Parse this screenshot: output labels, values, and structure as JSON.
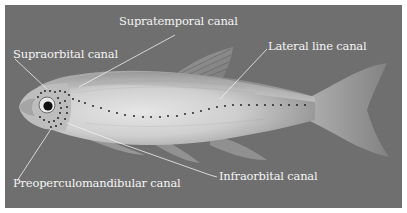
{
  "figure": {
    "background_color": "#6f6f6f",
    "label_color": "#f4f4f4",
    "labels": [
      {
        "id": "supratemporal",
        "text": "Supratemporal canal"
      },
      {
        "id": "supraorbital",
        "text": "Supraorbital canal"
      },
      {
        "id": "lateral-line",
        "text": "Lateral line canal"
      },
      {
        "id": "preoperculomandibular",
        "text": "Preoperculomandibular canal"
      },
      {
        "id": "infraorbital",
        "text": "Infraorbital canal"
      }
    ]
  }
}
